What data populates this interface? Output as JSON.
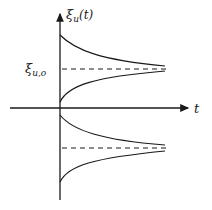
{
  "diagram": {
    "y_axis_label": "ξ",
    "y_axis_label_sub": "u",
    "y_axis_label_arg": "(t)",
    "level_label": "ξ",
    "level_label_sub": "u,o",
    "x_axis_label": "t",
    "colors": {
      "ink": "#1a1a1a",
      "background": "#ffffff"
    }
  }
}
